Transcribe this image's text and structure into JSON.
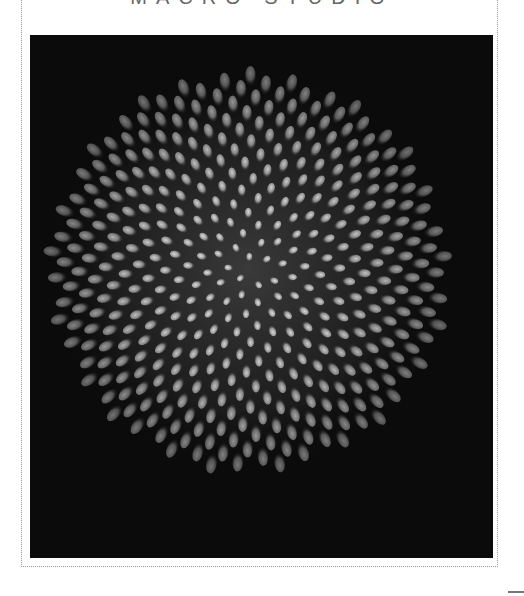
{
  "header": {
    "title": "MACRO STUDIO"
  },
  "photo": {
    "subject": "flower-cone-closeup",
    "style": "grayscale",
    "background_color": "#0b0b0b",
    "highlight_color": "#d8d8d8"
  },
  "frame": {
    "border_style": "dotted",
    "border_color": "#999999"
  }
}
